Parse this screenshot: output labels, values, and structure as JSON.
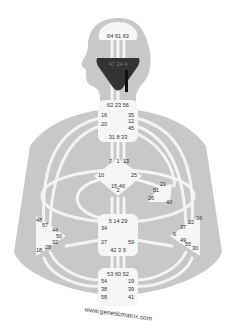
{
  "colors": {
    "background": "#ffffff",
    "body_silhouette": "#c8c8c8",
    "channel": "#f4f4f4",
    "center_fill": "#f6f6f6",
    "defined_center": "#333333",
    "text": "#333333"
  },
  "centers": {
    "head": {
      "gates": [
        "64",
        "61",
        "63"
      ]
    },
    "ajna": {
      "gates_row": [
        "47",
        "24",
        "4"
      ],
      "gate_right": "11"
    },
    "throat": {
      "top": [
        "62",
        "23",
        "56"
      ],
      "left": [
        "16",
        "20"
      ],
      "right": [
        "35",
        "12",
        "45"
      ],
      "bottom": [
        "31",
        "8",
        "33"
      ]
    },
    "g": {
      "top": "1",
      "left_upper": "7",
      "right_upper": "13",
      "left": "10",
      "right": "25",
      "bottom": [
        "15",
        "2",
        "46"
      ]
    },
    "heart": {
      "gates": [
        "21",
        "51",
        "26",
        "40"
      ]
    },
    "spleen": {
      "gates": [
        "48",
        "57",
        "44",
        "50",
        "32",
        "28",
        "18"
      ]
    },
    "solar_plexus": {
      "gates": [
        "36",
        "22",
        "37",
        "6",
        "49",
        "55",
        "30"
      ]
    },
    "sacral": {
      "top": [
        "5",
        "14",
        "29"
      ],
      "left": [
        "34",
        "27"
      ],
      "right": [
        "59"
      ],
      "bottom": [
        "42",
        "3",
        "9"
      ]
    },
    "root": {
      "top": [
        "53",
        "60",
        "52"
      ],
      "left": [
        "54",
        "38",
        "58"
      ],
      "right": [
        "19",
        "39",
        "41"
      ]
    }
  },
  "watermark": "www.geneticmatrix.com"
}
